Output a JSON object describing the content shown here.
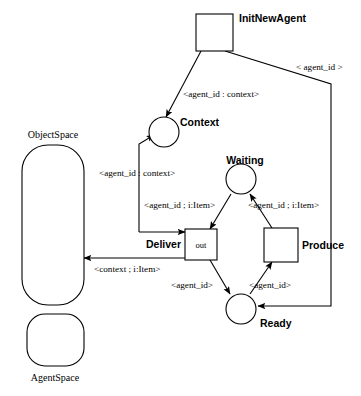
{
  "diagram": {
    "background_color": "#ffffff",
    "stroke_color": "#000000",
    "transitions": [
      {
        "id": "init",
        "label": "InitNewAgent",
        "inner_label": ""
      },
      {
        "id": "deliver",
        "label": "Deliver",
        "inner_label": "out"
      },
      {
        "id": "produce",
        "label": "Produce",
        "inner_label": ""
      }
    ],
    "places": [
      {
        "id": "context",
        "label": "Context"
      },
      {
        "id": "waiting",
        "label": "Waiting"
      },
      {
        "id": "ready",
        "label": "Ready"
      }
    ],
    "spaces": [
      {
        "id": "objectspace",
        "label": "ObjectSpace"
      },
      {
        "id": "agentspace",
        "label": "AgentSpace"
      }
    ],
    "arc_labels": {
      "init_to_context": "<agent_id : context>",
      "init_to_ready": "< agent_id >",
      "objectspace_to_context": "<agent_id : context>",
      "waiting_to_deliver": "<agent_id ; i:Item>",
      "produce_to_waiting": "<agent_id ; i:Item>",
      "deliver_to_objectspace": "<context ; i:Item>",
      "deliver_to_ready": "<agent_id>",
      "ready_to_produce": "<agent_id>"
    }
  }
}
